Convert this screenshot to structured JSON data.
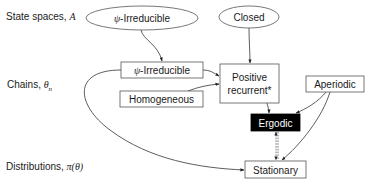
{
  "rows": {
    "state_spaces": {
      "label": "State spaces, ",
      "symbol": "A"
    },
    "chains": {
      "label": "Chains, ",
      "symbol": "θ",
      "subscript": "n"
    },
    "distributions": {
      "label": "Distributions, ",
      "symbol": "π(θ)"
    }
  },
  "nodes": {
    "state_irreducible": {
      "prefix": "ψ",
      "label": "-Irreducible",
      "shape": "ellipse"
    },
    "closed": {
      "label": "Closed",
      "shape": "ellipse"
    },
    "chain_irreducible": {
      "prefix": "ψ",
      "label": "-Irreducible",
      "shape": "box"
    },
    "homogeneous": {
      "label": "Homogeneous",
      "shape": "box"
    },
    "positive_recurrent": {
      "line1": "Positive",
      "line2": "recurrent*",
      "shape": "box"
    },
    "aperiodic": {
      "label": "Aperiodic",
      "shape": "box"
    },
    "ergodic": {
      "label": "Ergodic",
      "shape": "box",
      "fill": "#000000",
      "text_color": "#ffffff"
    },
    "stationary": {
      "label": "Stationary",
      "shape": "box"
    }
  },
  "edges": [
    {
      "from": "state_irreducible",
      "to": "chain_irreducible",
      "style": "solid"
    },
    {
      "from": "closed",
      "to": "positive_recurrent",
      "style": "solid"
    },
    {
      "from": "chain_irreducible",
      "to": "positive_recurrent",
      "style": "solid"
    },
    {
      "from": "homogeneous",
      "to": "positive_recurrent",
      "style": "solid"
    },
    {
      "from": "chain_irreducible",
      "to": "stationary",
      "style": "solid"
    },
    {
      "from": "positive_recurrent",
      "to": "ergodic",
      "style": "solid"
    },
    {
      "from": "aperiodic",
      "to": "ergodic",
      "style": "solid"
    },
    {
      "from": "aperiodic",
      "to": "stationary",
      "style": "solid"
    },
    {
      "from": "ergodic",
      "to": "stationary",
      "style": "dashed-bidirectional"
    }
  ],
  "colors": {
    "stroke": "#555555",
    "text": "#1a1a1a",
    "highlight_fill": "#000000"
  }
}
